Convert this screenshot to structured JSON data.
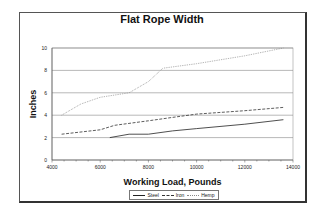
{
  "chart_data": {
    "type": "line",
    "title": "Flat Rope Width",
    "xlabel": "Working Load, Pounds",
    "ylabel": "Inches",
    "xlim": [
      4000,
      14000
    ],
    "ylim": [
      0,
      10
    ],
    "x_ticks": [
      4000,
      6000,
      8000,
      10000,
      12000,
      14000
    ],
    "y_ticks": [
      0,
      2,
      4,
      6,
      8,
      10
    ],
    "grid": "horizontal",
    "legend_position": "bottom",
    "series": [
      {
        "name": "Steel",
        "style": "solid",
        "color": "#222222",
        "x": [
          6400,
          7200,
          8000,
          9000,
          10000,
          12000,
          13600
        ],
        "values": [
          2.0,
          2.3,
          2.3,
          2.6,
          2.8,
          3.2,
          3.6
        ]
      },
      {
        "name": "Iron",
        "style": "dashed",
        "color": "#333333",
        "x": [
          4400,
          6000,
          6600,
          8000,
          9000,
          10000,
          12000,
          13600
        ],
        "values": [
          2.3,
          2.7,
          3.1,
          3.5,
          3.8,
          4.1,
          4.4,
          4.7
        ]
      },
      {
        "name": "Hemp",
        "style": "dotted",
        "color": "#888888",
        "x": [
          4400,
          5200,
          6000,
          7200,
          8000,
          8600,
          10000,
          12000,
          13600
        ],
        "values": [
          4.0,
          5.0,
          5.6,
          6.0,
          7.0,
          8.2,
          8.6,
          9.3,
          10.0
        ]
      }
    ]
  },
  "legend": {
    "steel": "Steel",
    "iron": "Iron",
    "hemp": "Hemp"
  }
}
